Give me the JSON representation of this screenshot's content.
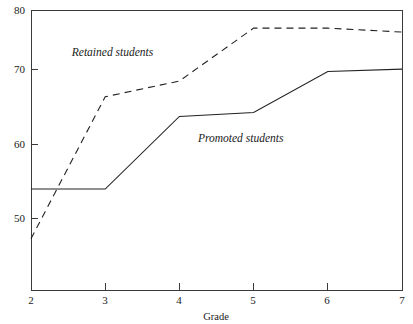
{
  "chart_data": {
    "type": "line",
    "title": "",
    "subtitle": "",
    "xlabel": "Grade",
    "ylabel": "",
    "x": [
      2,
      3,
      4,
      5,
      6,
      7
    ],
    "xticklabels": [
      "2",
      "3",
      "4",
      "5",
      "6",
      "7"
    ],
    "yticklabels": [
      "50",
      "60",
      "70",
      "80"
    ],
    "yticks": [
      50,
      60,
      70,
      80
    ],
    "xlim": [
      2,
      7
    ],
    "ylim": [
      44.5,
      80
    ],
    "grid": false,
    "legend_position": "inline-annotation",
    "series": [
      {
        "name": "Retained students",
        "style": "dashed",
        "color": "#222222",
        "values": [
          51.0,
          69.0,
          71.0,
          77.7,
          77.7,
          77.2
        ],
        "annotation": "Retained students",
        "annotation_x": 2.55,
        "annotation_y": 74.2
      },
      {
        "name": "Promoted students",
        "style": "solid",
        "color": "#222222",
        "values": [
          57.3,
          57.3,
          66.5,
          67.0,
          72.2,
          72.5
        ],
        "annotation": "Promoted students",
        "annotation_x": 4.25,
        "annotation_y": 63.3
      }
    ]
  },
  "axes": {
    "x_axis_title": "Grade"
  }
}
